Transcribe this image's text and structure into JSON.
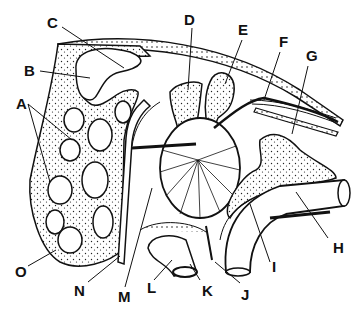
{
  "diagram": {
    "type": "anatomical-cross-section",
    "style": "black ink line drawing with stippled bone",
    "colors": {
      "ink": "#111111",
      "background": "#ffffff",
      "stipple": "#222222"
    },
    "labels": [
      {
        "id": "A",
        "text": "A",
        "x": 16,
        "y": 103
      },
      {
        "id": "B",
        "text": "B",
        "x": 24,
        "y": 67
      },
      {
        "id": "C",
        "text": "C",
        "x": 47,
        "y": 19
      },
      {
        "id": "D",
        "text": "D",
        "x": 184,
        "y": 15
      },
      {
        "id": "E",
        "text": "E",
        "x": 238,
        "y": 25
      },
      {
        "id": "F",
        "text": "F",
        "x": 279,
        "y": 37
      },
      {
        "id": "G",
        "text": "G",
        "x": 306,
        "y": 51
      },
      {
        "id": "H",
        "text": "H",
        "x": 333,
        "y": 246
      },
      {
        "id": "I",
        "text": "I",
        "x": 272,
        "y": 264
      },
      {
        "id": "J",
        "text": "J",
        "x": 241,
        "y": 288
      },
      {
        "id": "K",
        "text": "K",
        "x": 202,
        "y": 284
      },
      {
        "id": "L",
        "text": "L",
        "x": 147,
        "y": 281
      },
      {
        "id": "M",
        "text": "M",
        "x": 118,
        "y": 290
      },
      {
        "id": "N",
        "text": "N",
        "x": 74,
        "y": 284
      },
      {
        "id": "O",
        "text": "O",
        "x": 15,
        "y": 265
      }
    ]
  }
}
